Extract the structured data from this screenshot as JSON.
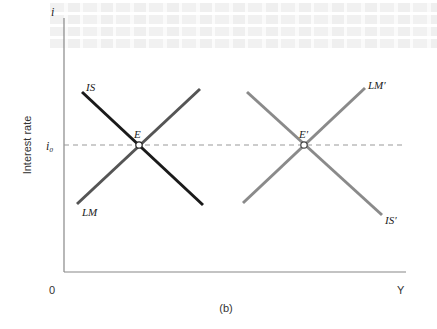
{
  "figure": {
    "panel_label": "(b)",
    "y_axis": {
      "symbol": "i",
      "title": "Interest rate",
      "tick_label": "i₀"
    },
    "x_axis": {
      "symbol": "Y",
      "origin_label": "0"
    },
    "curves": [
      {
        "id": "IS",
        "label": "IS",
        "color": "#1a1a1a",
        "slope": "downward"
      },
      {
        "id": "LM",
        "label": "LM",
        "color": "#555555",
        "slope": "upward"
      },
      {
        "id": "IS_prime",
        "label": "IS′",
        "color": "#8a8a8a",
        "slope": "downward"
      },
      {
        "id": "LM_prime",
        "label": "LM′",
        "color": "#8a8a8a",
        "slope": "upward"
      }
    ],
    "equilibria": [
      {
        "id": "E",
        "label": "E",
        "at": "i₀"
      },
      {
        "id": "E_prime",
        "label": "E′",
        "at": "i₀"
      }
    ],
    "reference_line": {
      "label": "i₀",
      "style": "dashed"
    }
  },
  "colors": {
    "axis": "#888888",
    "dashed": "#999999",
    "is": "#1a1a1a",
    "lm": "#555555",
    "shifted": "#8a8a8a"
  }
}
